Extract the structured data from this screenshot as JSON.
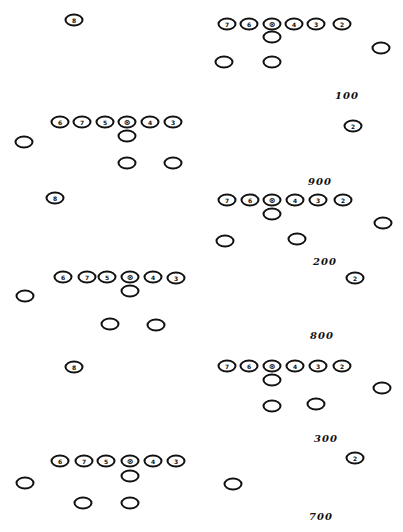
{
  "diagram": {
    "title": "",
    "play_labels": [
      {
        "text": "100",
        "x": 347,
        "y": 95
      },
      {
        "text": "900",
        "x": 320,
        "y": 181
      },
      {
        "text": "200",
        "x": 325,
        "y": 261
      },
      {
        "text": "800",
        "x": 322,
        "y": 335
      },
      {
        "text": "300",
        "x": 326,
        "y": 438
      },
      {
        "text": "700",
        "x": 321,
        "y": 516
      }
    ],
    "formations": [
      {
        "id": "left-1",
        "players": [
          {
            "label": "8",
            "x": 74,
            "y": 20
          },
          {
            "label": "6",
            "x": 60,
            "y": 122
          },
          {
            "label": "7",
            "x": 82,
            "y": 122
          },
          {
            "label": "5",
            "x": 105,
            "y": 122
          },
          {
            "label": "⊗",
            "x": 127,
            "y": 122
          },
          {
            "label": "4",
            "x": 150,
            "y": 122
          },
          {
            "label": "3",
            "x": 173,
            "y": 122
          },
          {
            "label": "",
            "x": 127,
            "y": 136
          },
          {
            "label": "",
            "x": 24,
            "y": 142
          },
          {
            "label": "",
            "x": 127,
            "y": 163
          },
          {
            "label": "",
            "x": 173,
            "y": 163
          }
        ]
      },
      {
        "id": "left-2",
        "players": [
          {
            "label": "8",
            "x": 55,
            "y": 198
          },
          {
            "label": "6",
            "x": 63,
            "y": 277
          },
          {
            "label": "7",
            "x": 87,
            "y": 277
          },
          {
            "label": "5",
            "x": 107,
            "y": 277
          },
          {
            "label": "⊗",
            "x": 130,
            "y": 277
          },
          {
            "label": "4",
            "x": 153,
            "y": 277
          },
          {
            "label": "3",
            "x": 176,
            "y": 278
          },
          {
            "label": "",
            "x": 130,
            "y": 291
          },
          {
            "label": "",
            "x": 25,
            "y": 296
          },
          {
            "label": "",
            "x": 110,
            "y": 324
          },
          {
            "label": "",
            "x": 156,
            "y": 325
          }
        ]
      },
      {
        "id": "left-3",
        "players": [
          {
            "label": "8",
            "x": 74,
            "y": 367
          },
          {
            "label": "6",
            "x": 60,
            "y": 461
          },
          {
            "label": "7",
            "x": 84,
            "y": 461
          },
          {
            "label": "5",
            "x": 106,
            "y": 461
          },
          {
            "label": "⊗",
            "x": 130,
            "y": 461
          },
          {
            "label": "4",
            "x": 153,
            "y": 461
          },
          {
            "label": "3",
            "x": 176,
            "y": 461
          },
          {
            "label": "",
            "x": 130,
            "y": 476
          },
          {
            "label": "",
            "x": 25,
            "y": 483
          },
          {
            "label": "",
            "x": 83,
            "y": 503
          },
          {
            "label": "",
            "x": 130,
            "y": 503
          }
        ]
      },
      {
        "id": "right-1",
        "players": [
          {
            "label": "7",
            "x": 227,
            "y": 24
          },
          {
            "label": "6",
            "x": 249,
            "y": 24
          },
          {
            "label": "⊗",
            "x": 272,
            "y": 24
          },
          {
            "label": "4",
            "x": 294,
            "y": 24
          },
          {
            "label": "3",
            "x": 316,
            "y": 24
          },
          {
            "label": "2",
            "x": 342,
            "y": 24
          },
          {
            "label": "",
            "x": 272,
            "y": 37
          },
          {
            "label": "",
            "x": 381,
            "y": 48
          },
          {
            "label": "",
            "x": 224,
            "y": 62
          },
          {
            "label": "",
            "x": 272,
            "y": 62
          },
          {
            "label": "2",
            "x": 353,
            "y": 126
          }
        ]
      },
      {
        "id": "right-2",
        "players": [
          {
            "label": "7",
            "x": 227,
            "y": 200
          },
          {
            "label": "6",
            "x": 250,
            "y": 200
          },
          {
            "label": "⊗",
            "x": 272,
            "y": 200
          },
          {
            "label": "4",
            "x": 295,
            "y": 200
          },
          {
            "label": "3",
            "x": 318,
            "y": 200
          },
          {
            "label": "2",
            "x": 343,
            "y": 200
          },
          {
            "label": "",
            "x": 272,
            "y": 214
          },
          {
            "label": "",
            "x": 383,
            "y": 223
          },
          {
            "label": "",
            "x": 225,
            "y": 241
          },
          {
            "label": "",
            "x": 297,
            "y": 239
          },
          {
            "label": "2",
            "x": 355,
            "y": 278
          }
        ]
      },
      {
        "id": "right-3",
        "players": [
          {
            "label": "7",
            "x": 227,
            "y": 366
          },
          {
            "label": "6",
            "x": 249,
            "y": 366
          },
          {
            "label": "⊗",
            "x": 272,
            "y": 366
          },
          {
            "label": "4",
            "x": 295,
            "y": 366
          },
          {
            "label": "3",
            "x": 318,
            "y": 366
          },
          {
            "label": "2",
            "x": 342,
            "y": 366
          },
          {
            "label": "",
            "x": 272,
            "y": 380
          },
          {
            "label": "",
            "x": 382,
            "y": 388
          },
          {
            "label": "",
            "x": 272,
            "y": 406
          },
          {
            "label": "",
            "x": 316,
            "y": 404
          },
          {
            "label": "2",
            "x": 355,
            "y": 458
          },
          {
            "label": "",
            "x": 233,
            "y": 484
          }
        ]
      }
    ]
  }
}
